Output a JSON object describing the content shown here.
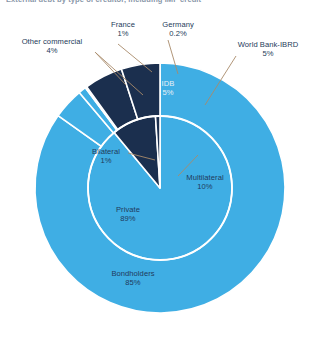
{
  "chart_title": "External debt by type of creditor, including IMF credit",
  "colors": {
    "light_blue": "#3FAEE4",
    "dark_navy": "#1B2F4E",
    "separator": "#FFFFFF",
    "leader_line": "#A88A6A",
    "label_text": "#1F3A5C",
    "label_text_on_dark": "#E8EEF5",
    "background": "#FFFFFF"
  },
  "chart_data": {
    "type": "pie",
    "title": "External debt by type of creditor, including IMF credit",
    "subtitle": "",
    "xlabel": "",
    "ylabel": "",
    "legend_position": "none",
    "grid": false,
    "note": "Nested pie: inner ring shows creditor groups, outer ring breaks them into individual creditors. Percentages are share of total external debt.",
    "rings": [
      {
        "name": "inner",
        "radius_px": 72,
        "slices": [
          {
            "label": "Private",
            "value": 89,
            "value_text": "89%",
            "color": "#3FAEE4"
          },
          {
            "label": "Multilateral",
            "value": 10,
            "value_text": "10%",
            "color": "#1B2F4E"
          },
          {
            "label": "Bilateral",
            "value": 1,
            "value_text": "1%",
            "color": "#1B2F4E"
          }
        ]
      },
      {
        "name": "outer",
        "radius_px": 125,
        "slices": [
          {
            "label": "Bondholders",
            "value": 85,
            "value_text": "85%",
            "color": "#3FAEE4"
          },
          {
            "label": "Other commercial",
            "value": 4,
            "value_text": "4%",
            "color": "#3FAEE4"
          },
          {
            "label": "France",
            "value": 1,
            "value_text": "1%",
            "color": "#3FAEE4"
          },
          {
            "label": "Germany",
            "value": 0.2,
            "value_text": "0.2%",
            "color": "#1B2F4E"
          },
          {
            "label": "IDB",
            "value": 5,
            "value_text": "5%",
            "color": "#1B2F4E"
          },
          {
            "label": "World Bank-IBRD",
            "value": 5,
            "value_text": "5%",
            "color": "#1B2F4E"
          }
        ]
      }
    ],
    "categories": [
      "Bondholders",
      "Other commercial",
      "France",
      "Germany",
      "IDB",
      "World Bank-IBRD"
    ],
    "values": [
      85,
      4,
      1,
      0.2,
      5,
      5
    ]
  },
  "labels": {
    "other_commercial": {
      "name": "Other commercial",
      "value": "4%"
    },
    "france": {
      "name": "France",
      "value": "1%"
    },
    "germany": {
      "name": "Germany",
      "value": "0.2%"
    },
    "world_bank": {
      "name": "World Bank-IBRD",
      "value": "5%"
    },
    "idb": {
      "name": "IDB",
      "value": "5%"
    },
    "multilateral": {
      "name": "Multilateral",
      "value": "10%"
    },
    "bilateral": {
      "name": "Bilateral",
      "value": "1%"
    },
    "private": {
      "name": "Private",
      "value": "89%"
    },
    "bondholders": {
      "name": "Bondholders",
      "value": "85%"
    }
  }
}
